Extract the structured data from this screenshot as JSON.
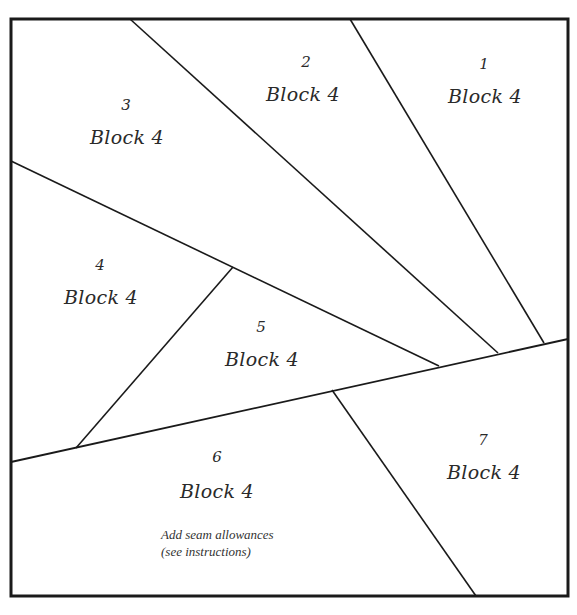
{
  "pattern": {
    "stroke_color": "#1a1a1a",
    "border": {
      "x": 11,
      "y": 19,
      "width": 557,
      "height": 577
    },
    "lines": [
      {
        "id": "A",
        "x1": 130,
        "y1": 19,
        "x2": 498,
        "y2": 353
      },
      {
        "id": "B",
        "x1": 350,
        "y1": 19,
        "x2": 544,
        "y2": 343
      },
      {
        "id": "C",
        "x1": 11,
        "y1": 161,
        "x2": 439,
        "y2": 366
      },
      {
        "id": "D",
        "x1": 11,
        "y1": 462,
        "x2": 568,
        "y2": 339
      },
      {
        "id": "E",
        "x1": 233,
        "y1": 267,
        "x2": 76,
        "y2": 448
      },
      {
        "id": "F",
        "x1": 332,
        "y1": 390,
        "x2": 476,
        "y2": 596
      }
    ]
  },
  "pieces": [
    {
      "number": "1",
      "label": "Block 4"
    },
    {
      "number": "2",
      "label": "Block 4"
    },
    {
      "number": "3",
      "label": "Block 4"
    },
    {
      "number": "4",
      "label": "Block 4"
    },
    {
      "number": "5",
      "label": "Block 4"
    },
    {
      "number": "6",
      "label": "Block 4"
    },
    {
      "number": "7",
      "label": "Block 4"
    }
  ],
  "note": {
    "line1": "Add seam allowances",
    "line2": "(see instructions)"
  }
}
